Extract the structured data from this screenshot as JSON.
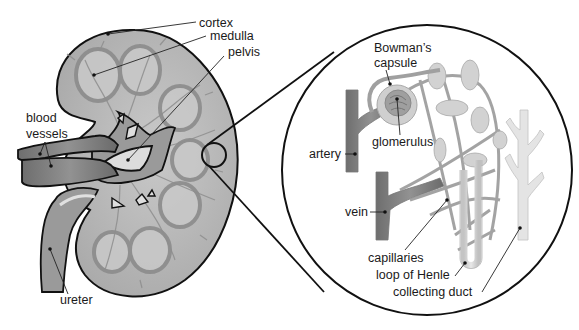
{
  "diagram": {
    "colors": {
      "kidney_fill": "#b9b9b9",
      "kidney_dark": "#8a8a8a",
      "vessel": "#7d7d7d",
      "pelvis_light": "#d6d6d6",
      "outline": "#111111",
      "nephron_light": "#d4d4d4",
      "background": "#ffffff"
    },
    "kidney_labels": {
      "cortex": "cortex",
      "medulla": "medulla",
      "pelvis": "pelvis",
      "blood_vessels_line1": "blood",
      "blood_vessels_line2": "vessels",
      "ureter": "ureter"
    },
    "nephron_labels": {
      "bowmans_line1": "Bowman’s",
      "bowmans_line2": "capsule",
      "glomerulus": "glomerulus",
      "artery": "artery",
      "vein": "vein",
      "capillaries": "capillaries",
      "loop_of_henle": "loop of Henle",
      "collecting_duct": "collecting duct"
    }
  }
}
